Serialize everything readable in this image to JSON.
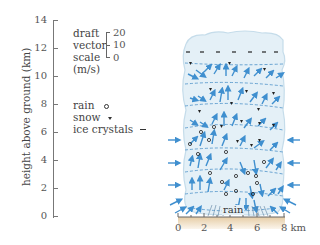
{
  "figure": {
    "type": "thunderstorm cell cross-section",
    "y_axis": {
      "label": "height above ground (km)",
      "ticks": [
        "0",
        "2",
        "4",
        "6",
        "8",
        "10",
        "12",
        "14"
      ]
    },
    "x_axis": {
      "ticks": [
        "0",
        "2",
        "4",
        "6"
      ],
      "last_tick": "8 km"
    },
    "draft_scale": {
      "title_lines": [
        "draft",
        "vector",
        "scale",
        "(m/s)"
      ],
      "values": [
        "20",
        "10",
        "0"
      ]
    },
    "legend": {
      "items": [
        {
          "label": "rain",
          "symbol": "open-circle"
        },
        {
          "label": "snow",
          "symbol": "filled-triangle"
        },
        {
          "label": "ice crystals",
          "symbol": "dash"
        }
      ]
    },
    "ground_label": "rain",
    "colors": {
      "arrow": "#3f8fcf",
      "cloud": "#e4f0f7",
      "cloud_edge": "#c5dcea",
      "dashed_line": "#4a90c8",
      "ground": "#e9d6b8",
      "axis": "#666666"
    }
  }
}
